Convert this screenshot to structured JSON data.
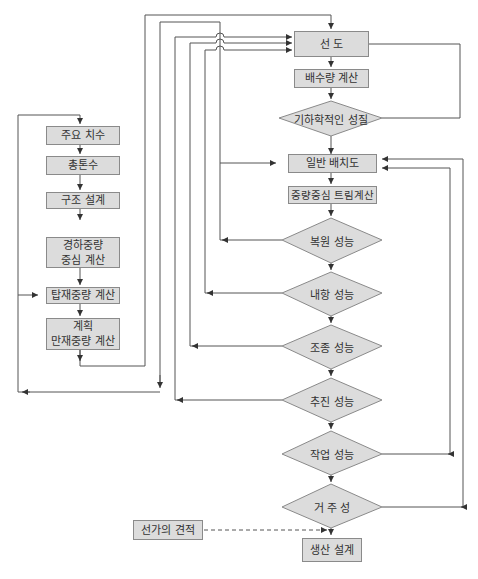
{
  "diagram": {
    "type": "flowchart",
    "colors": {
      "box_fill": "#dcdcdc",
      "box_border": "#8a8a8a",
      "line": "#555555",
      "text": "#333333"
    },
    "left_column": [
      {
        "id": "main_dimensions",
        "label": "주요 치수"
      },
      {
        "id": "tonnage",
        "label": "총톤수"
      },
      {
        "id": "structural_design",
        "label": "구조 설계"
      },
      {
        "id": "lightweight_cg",
        "label": "경하중량\n중심 계산"
      },
      {
        "id": "payload_calc",
        "label": "탑재중량 계산"
      },
      {
        "id": "full_load_calc",
        "label": "계획\n만재중량 계산"
      }
    ],
    "main_column": [
      {
        "id": "lines",
        "label": "선 도",
        "shape": "box"
      },
      {
        "id": "displacement",
        "label": "배수량 계산",
        "shape": "box"
      },
      {
        "id": "geometric_props",
        "label": "기하학적인 성질",
        "shape": "diamond"
      },
      {
        "id": "general_arrangement",
        "label": "일반 배치도",
        "shape": "box"
      },
      {
        "id": "cg_trim",
        "label": "중량중심 트림계산",
        "shape": "box"
      },
      {
        "id": "stability",
        "label": "복원 성능",
        "shape": "diamond"
      },
      {
        "id": "seakeeping",
        "label": "내항 성능",
        "shape": "diamond"
      },
      {
        "id": "maneuvering",
        "label": "조종 성능",
        "shape": "diamond"
      },
      {
        "id": "propulsion",
        "label": "추진 성능",
        "shape": "diamond"
      },
      {
        "id": "operability",
        "label": "작업 성능",
        "shape": "diamond"
      },
      {
        "id": "habitability",
        "label": "거 주 성",
        "shape": "diamond"
      },
      {
        "id": "production_design",
        "label": "생산 설계",
        "shape": "box"
      }
    ],
    "side_inputs": [
      {
        "id": "cost_estimate",
        "label": "선가의 견적",
        "connects_to": "production_design",
        "style": "dashed"
      }
    ]
  }
}
